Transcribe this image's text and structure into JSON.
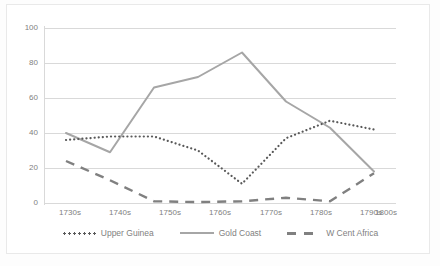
{
  "chart_data": {
    "type": "line",
    "title": "",
    "xlabel": "",
    "ylabel": "",
    "categories": [
      "1730s",
      "1740s",
      "1750s",
      "1760s",
      "1770s",
      "1780s",
      "1790s",
      "1800s"
    ],
    "ylim": [
      0,
      100
    ],
    "yticks": [
      0,
      20,
      40,
      60,
      80,
      100
    ],
    "grid": true,
    "legend_position": "bottom",
    "series": [
      {
        "name": "Upper Guinea",
        "style": "dotted",
        "color": "#595959",
        "values": [
          36,
          38,
          38,
          30,
          11,
          37,
          47,
          42
        ]
      },
      {
        "name": "Gold Coast",
        "style": "solid",
        "color": "#a6a6a6",
        "values": [
          40,
          29,
          66,
          72,
          86,
          58,
          43,
          18
        ]
      },
      {
        "name": "W Cent Africa",
        "style": "dashed",
        "color": "#808080",
        "values": [
          24,
          13,
          1,
          0.5,
          1,
          3,
          1,
          17
        ]
      }
    ]
  },
  "axis": {
    "ytick_labels": [
      "100",
      "80",
      "60",
      "40",
      "20",
      "0"
    ],
    "xtick_labels": [
      "1730s",
      "1740s",
      "1750s",
      "1760s",
      "1770s",
      "1780s",
      "1790s",
      "1800s"
    ]
  },
  "legend": {
    "items": [
      {
        "label": "Upper Guinea"
      },
      {
        "label": "Gold Coast"
      },
      {
        "label": "W Cent Africa"
      }
    ]
  }
}
